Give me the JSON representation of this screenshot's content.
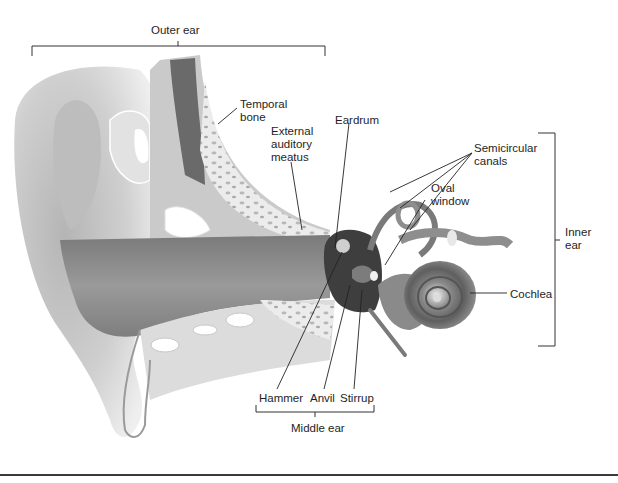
{
  "diagram": {
    "groups": {
      "outer_ear": "Outer ear",
      "middle_ear": "Middle ear",
      "inner_ear": "Inner\near"
    },
    "labels": {
      "temporal_bone": "Temporal\nbone",
      "external_auditory_meatus": "External\nauditory\nmeatus",
      "eardrum": "Eardrum",
      "semicircular_canals": "Semicircular\ncanals",
      "oval_window": "Oval\nwindow",
      "cochlea": "Cochlea",
      "hammer": "Hammer",
      "anvil": "Anvil",
      "stirrup": "Stirrup"
    },
    "colors": {
      "tissue_light": "#d9d9d9",
      "tissue_mid": "#a8a8a8",
      "tissue_dark": "#6e6e6e",
      "canal": "#8a8a8a",
      "line": "#1a1a1a"
    }
  }
}
